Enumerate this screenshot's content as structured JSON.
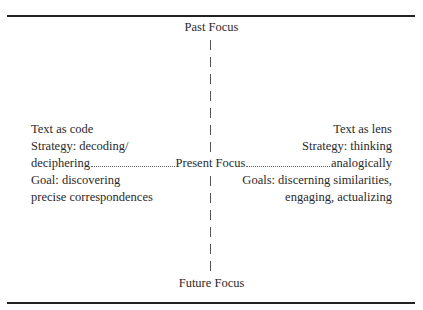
{
  "axis": {
    "top": "Past Focus",
    "center": "Present Focus",
    "bottom": "Future Focus"
  },
  "left": {
    "title": "Text as code",
    "strategy_line1": "Strategy: decoding/",
    "strategy_line2": "deciphering",
    "goal_line1": "Goal: discovering",
    "goal_line2": "precise correspondences"
  },
  "right": {
    "title": "Text as lens",
    "strategy_line1": "Strategy: thinking",
    "strategy_line2": "analogically",
    "goal_line1": "Goals: discerning similarities,",
    "goal_line2": "engaging, actualizing"
  }
}
